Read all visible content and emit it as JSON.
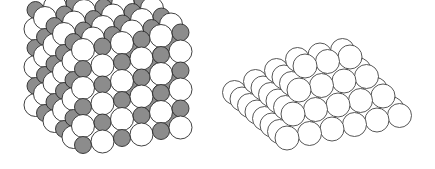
{
  "figures": [
    {
      "id": "rock-salt-cube",
      "description": "Rock salt (NaCl-type) cubic lattice of large white and small gray spheres",
      "colors": {
        "large": "#ffffff",
        "small": "#8c8c8c",
        "stroke": "#2a2a2a"
      },
      "radius_large": 11.5,
      "radius_small": 8.5,
      "n": 6,
      "origin": [
        83,
        50
      ],
      "step_down": [
        0,
        19
      ],
      "step_right": [
        19.5,
        -3.5
      ],
      "step_back": [
        -9.5,
        -8
      ]
    },
    {
      "id": "sphere-pyramid",
      "description": "Stacked pyramid of equal white spheres",
      "colors": {
        "fill": "#ffffff",
        "stroke": "#444444"
      },
      "radius": 12,
      "layers": 5,
      "origin": [
        72,
        138
      ],
      "step_right": [
        22.5,
        -4.5
      ],
      "step_back": [
        -7.5,
        -6.5
      ],
      "step_up": [
        2,
        -24
      ]
    }
  ]
}
